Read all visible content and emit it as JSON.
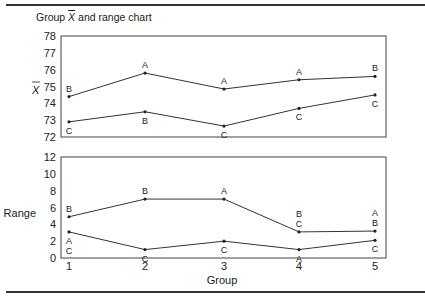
{
  "title": {
    "prefix": "Group ",
    "symbol": "X",
    "suffix": " and range chart"
  },
  "chart_data": [
    {
      "type": "line",
      "title": "Group X-bar and range chart",
      "panel": "xbar",
      "ylabel": "X̄",
      "xlabel": "",
      "ylim": [
        72,
        78
      ],
      "yticks": [
        72,
        73,
        74,
        75,
        76,
        77,
        78
      ],
      "categories": [
        1,
        2,
        3,
        4,
        5
      ],
      "grid": false,
      "series": [
        {
          "name": "max",
          "values": [
            74.4,
            75.8,
            74.85,
            75.4,
            75.6
          ],
          "point_labels": [
            [
              "B"
            ],
            [
              "A"
            ],
            [
              "A"
            ],
            [
              "A"
            ],
            [
              "B"
            ]
          ],
          "label_pos": "above"
        },
        {
          "name": "min",
          "values": [
            72.9,
            73.5,
            72.65,
            73.7,
            74.5
          ],
          "point_labels": [
            [
              "C"
            ],
            [
              "B"
            ],
            [
              "C"
            ],
            [
              "C"
            ],
            [
              "C"
            ]
          ],
          "label_pos": "below"
        }
      ]
    },
    {
      "type": "line",
      "panel": "range",
      "ylabel": "Range",
      "xlabel": "Group",
      "ylim": [
        0,
        12
      ],
      "yticks": [
        0,
        2,
        4,
        6,
        8,
        10,
        12
      ],
      "categories": [
        1,
        2,
        3,
        4,
        5
      ],
      "grid": false,
      "series": [
        {
          "name": "max",
          "values": [
            4.9,
            7.0,
            7.0,
            3.1,
            3.2
          ],
          "point_labels": [
            [
              "B"
            ],
            [
              "B"
            ],
            [
              "A"
            ],
            [
              "B",
              "C"
            ],
            [
              "A",
              "B"
            ]
          ],
          "label_pos": "above"
        },
        {
          "name": "min",
          "values": [
            3.1,
            1.0,
            2.0,
            1.0,
            2.1
          ],
          "point_labels": [
            [
              "A",
              "C"
            ],
            [
              "C"
            ],
            [
              "C"
            ],
            [
              "A"
            ],
            [
              "C"
            ]
          ],
          "label_pos": "below"
        }
      ]
    }
  ],
  "layout": {
    "plot_left": 61,
    "plot_right": 386,
    "group_x": [
      69,
      145,
      224,
      299,
      375
    ],
    "panels": [
      {
        "top": 36,
        "bottom": 137,
        "ylabel_x": 38,
        "ylabel_y": 90
      },
      {
        "top": 157,
        "bottom": 258,
        "ylabel_x": 36,
        "ylabel_y": 213
      }
    ],
    "xtick_y": 270,
    "xlabel_y": 284,
    "line_color": "#333333",
    "frame_color": "#444444"
  }
}
